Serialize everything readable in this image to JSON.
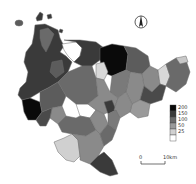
{
  "map": {
    "type": "choropleth",
    "colors": {
      "class_200": "#0a0a0a",
      "class_150": "#3a3a3a",
      "class_100": "#5c5c5c",
      "class_50": "#8a8a8a",
      "class_25": "#c4c4c4",
      "class_0": "#f4f4f4",
      "background": "#ffffff"
    },
    "legend": {
      "items": [
        {
          "label": "200",
          "color": "#0a0a0a"
        },
        {
          "label": "150",
          "color": "#3a3a3a"
        },
        {
          "label": "100",
          "color": "#6a6a6a"
        },
        {
          "label": "50",
          "color": "#9a9a9a"
        },
        {
          "label": "25",
          "color": "#d0d0d0"
        },
        {
          "label": "",
          "color": "#ffffff"
        }
      ]
    },
    "scale_bar": {
      "start_label": "0",
      "end_label": "10km"
    },
    "north_arrow": {
      "icon": "north-arrow-icon"
    }
  }
}
